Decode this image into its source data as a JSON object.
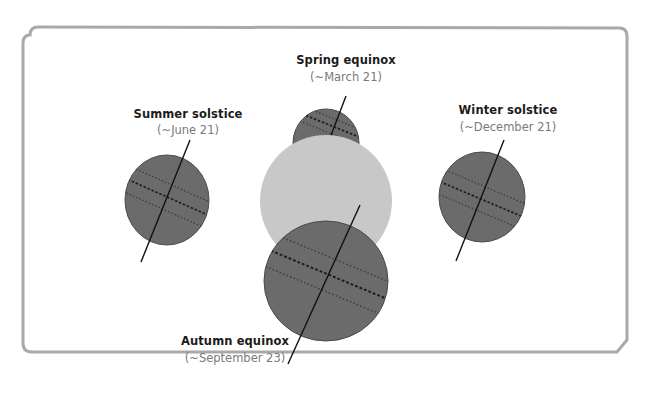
{
  "diagram": {
    "frame": {
      "border_color": "#a9a9a9",
      "background": "#ffffff"
    },
    "sun": {
      "label": "Sun",
      "color": "#c8c8c8",
      "cx": 326,
      "cy": 201,
      "r": 66
    },
    "globe_style": {
      "fill": "#6b6b6b",
      "stroke": "#4a4a4a",
      "axis_color": "#111111",
      "equator_color": "#1e1e1e",
      "tropic_color": "#3a3a3a"
    },
    "positions": [
      {
        "id": "summer",
        "title": "Summer solstice",
        "date": "(~June 21)",
        "title_pos": [
          188,
          118
        ],
        "date_pos": [
          188,
          134
        ],
        "globe": {
          "cx": 167,
          "cy": 200,
          "rx": 42,
          "ry": 45
        },
        "axis": [
          [
            190,
            140
          ],
          [
            141,
            262
          ]
        ]
      },
      {
        "id": "spring",
        "title": "Spring equinox",
        "date": "(~March 21)",
        "title_pos": [
          346,
          64
        ],
        "date_pos": [
          346,
          81
        ],
        "globe": {
          "cx": 326,
          "cy": 143,
          "rx": 33,
          "ry": 34
        },
        "axis": [
          [
            346,
            96
          ],
          [
            317,
            172
          ]
        ]
      },
      {
        "id": "winter",
        "title": "Winter solstice",
        "date": "(~December 21)",
        "title_pos": [
          508,
          114
        ],
        "date_pos": [
          508,
          131
        ],
        "globe": {
          "cx": 482,
          "cy": 197,
          "rx": 43,
          "ry": 45
        },
        "axis": [
          [
            504,
            140
          ],
          [
            456,
            261
          ]
        ]
      },
      {
        "id": "autumn",
        "title": "Autumn equinox",
        "date": "(~September 23)",
        "title_pos": [
          235,
          345
        ],
        "date_pos": [
          235,
          362
        ],
        "globe": {
          "cx": 326,
          "cy": 281,
          "rx": 62,
          "ry": 60
        },
        "axis": [
          [
            360,
            205
          ],
          [
            288,
            364
          ]
        ]
      }
    ]
  }
}
